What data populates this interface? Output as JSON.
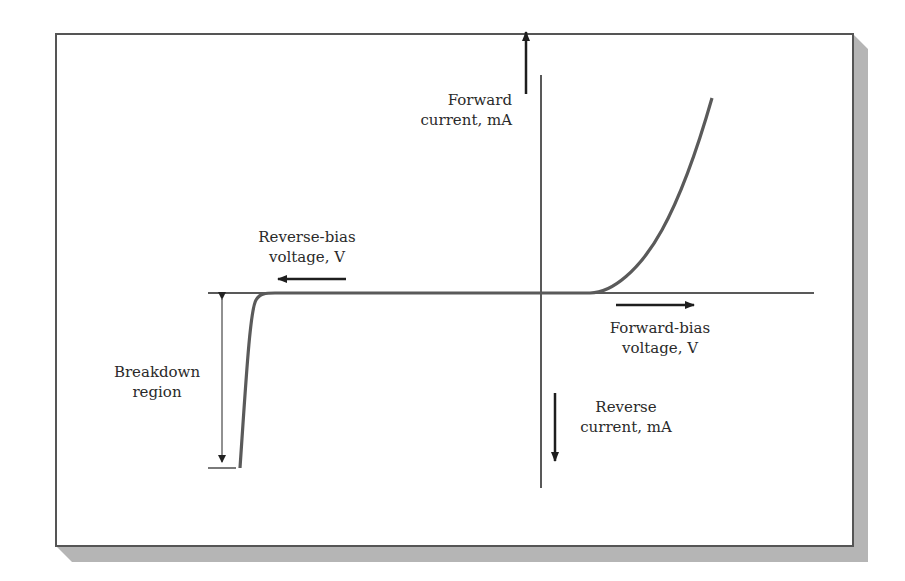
{
  "figure": {
    "labels": {
      "forward_current": [
        "Forward",
        "current, mA"
      ],
      "reverse_bias_voltage": [
        "Reverse-bias",
        "voltage, V"
      ],
      "forward_bias_voltage": [
        "Forward-bias",
        "voltage, V"
      ],
      "reverse_current": [
        "Reverse",
        "current, mA"
      ],
      "breakdown_region": [
        "Breakdown",
        "region"
      ]
    },
    "colors": {
      "frame": "#555555",
      "shadow": "#b5b5b5",
      "axis": "#222222",
      "curve": "#5a5a5a",
      "arrow": "#1e1e1e",
      "text": "#2a2a2a"
    }
  }
}
